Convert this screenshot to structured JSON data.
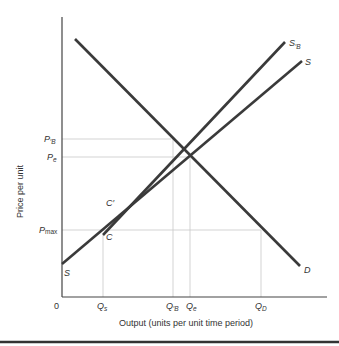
{
  "diagram": {
    "type": "supply-demand",
    "xlabel": "Output (units per unit time period)",
    "ylabel": "Price per unit",
    "origin_label": "0",
    "y_ticks": [
      {
        "main": "P",
        "sub": "′B",
        "name": "P'B"
      },
      {
        "main": "P",
        "sub": "e",
        "name": "Pe"
      },
      {
        "main": "P",
        "sub": "max",
        "name": "Pmax"
      }
    ],
    "x_ticks": [
      {
        "main": "Q",
        "sub": "s",
        "name": "Qs"
      },
      {
        "main": "Q",
        "sub": "′B",
        "name": "Q'B"
      },
      {
        "main": "Q",
        "sub": "e",
        "name": "Qe"
      },
      {
        "main": "Q",
        "sub": "D",
        "name": "QD"
      }
    ],
    "curves": [
      {
        "name": "D",
        "label": "D",
        "description": "Demand curve, downward sloping"
      },
      {
        "name": "S",
        "label": "S",
        "description": "Original supply curve, upward sloping"
      },
      {
        "name": "S'B",
        "label_main": "S",
        "label_sub": "′B",
        "description": "Shifted supply curve starting at C'"
      }
    ],
    "points": [
      {
        "name": "C",
        "label": "C"
      },
      {
        "name": "C'",
        "label": "C′"
      }
    ],
    "curve_labels": {
      "D": "D",
      "S_top": "S",
      "S_bottom": "S",
      "SB_main": "S",
      "SB_sub": "′B",
      "C": "C",
      "Cprime": "C′"
    },
    "colors": {
      "curve": "#3a3a3a",
      "axis": "#444444",
      "guide": "#c8c8c8",
      "rule": "#333333"
    }
  }
}
